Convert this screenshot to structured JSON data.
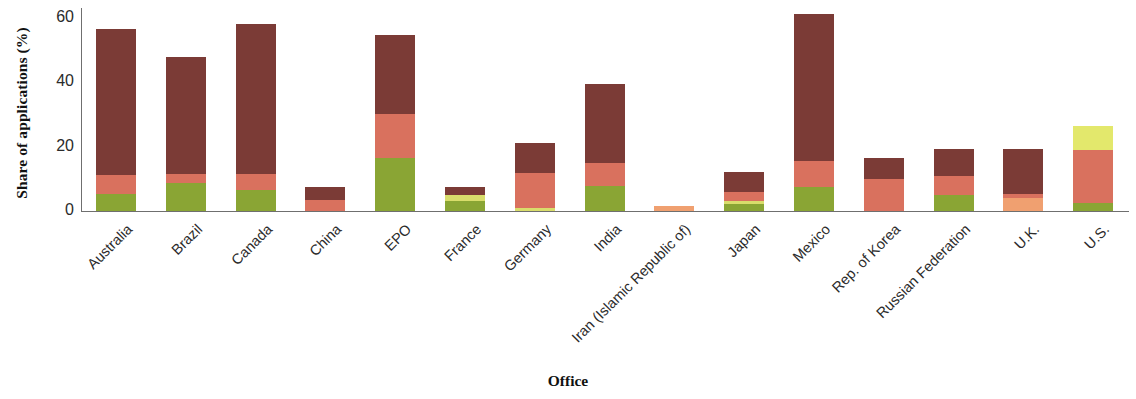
{
  "chart_data": {
    "type": "bar",
    "stacked": true,
    "title": "",
    "subtitle": "",
    "xlabel": "Office",
    "ylabel": "Share of applications (%)",
    "ylim": [
      0,
      63
    ],
    "yticks": [
      0,
      20,
      40,
      60
    ],
    "ytick_labels": [
      "0",
      "20",
      "40",
      "60"
    ],
    "grid": false,
    "legend": "none",
    "categories": [
      "Australia",
      "Brazil",
      "Canada",
      "China",
      "EPO",
      "France",
      "Germany",
      "India",
      "Iran (Islamic Republic of)",
      "Japan",
      "Mexico",
      "Rep. of Korea",
      "Russian Federation",
      "U.K.",
      "U.S."
    ],
    "series": [
      {
        "name": "segment-1",
        "color": "#8aa534",
        "values": [
          5.3,
          8.7,
          6.6,
          0.0,
          16.4,
          3.0,
          0.0,
          7.9,
          0.0,
          2.3,
          7.6,
          0.0,
          5.0,
          0.0,
          2.6
        ]
      },
      {
        "name": "segment-2",
        "color": "#f0a070",
        "values": [
          0.0,
          0.0,
          0.0,
          0.0,
          0.0,
          0.0,
          0.0,
          0.0,
          1.6,
          0.0,
          0.0,
          0.0,
          0.0,
          4.1,
          0.0
        ]
      },
      {
        "name": "segment-3",
        "color": "#d9dd6b",
        "values": [
          0.0,
          0.0,
          0.0,
          0.0,
          0.0,
          1.9,
          1.0,
          0.0,
          0.0,
          0.9,
          0.0,
          0.0,
          0.0,
          0.0,
          0.0
        ]
      },
      {
        "name": "segment-4",
        "color": "#d9715e",
        "values": [
          5.9,
          2.7,
          5.0,
          3.4,
          13.6,
          0.0,
          10.9,
          7.0,
          0.0,
          2.6,
          8.0,
          9.9,
          5.9,
          1.3,
          16.3
        ]
      },
      {
        "name": "segment-5",
        "color": "#7b3b36",
        "values": [
          45.2,
          36.3,
          46.3,
          3.9,
          24.5,
          2.6,
          9.3,
          24.6,
          0.0,
          6.3,
          45.5,
          6.6,
          8.2,
          13.7,
          0.0
        ]
      },
      {
        "name": "segment-6",
        "color": "#e3e86c",
        "values": [
          0.0,
          0.0,
          0.0,
          0.0,
          0.0,
          0.0,
          0.0,
          0.0,
          0.0,
          0.0,
          0.0,
          0.0,
          0.0,
          0.0,
          7.6
        ]
      }
    ],
    "totals": [
      56.4,
      47.7,
      57.9,
      7.3,
      54.5,
      7.5,
      21.2,
      39.5,
      1.6,
      12.1,
      61.1,
      16.5,
      19.1,
      19.1,
      26.5
    ]
  },
  "colors": {
    "axis": "#6f6f6f",
    "text": "#2b2b2b",
    "background": "#ffffff"
  }
}
